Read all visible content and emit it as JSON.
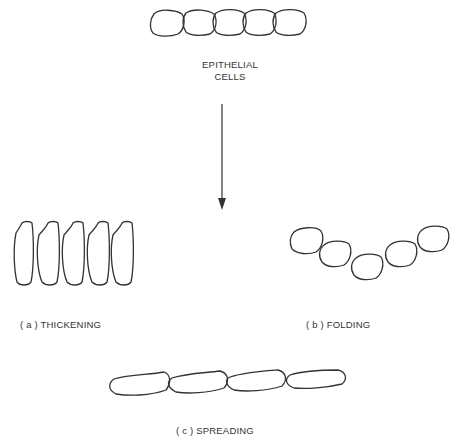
{
  "diagram": {
    "source": {
      "label_line1": "EPITHELIAL",
      "label_line2": "CELLS",
      "cell_count": 5
    },
    "transition": {
      "icon": "arrow-down-icon"
    },
    "outcomes": [
      {
        "id": "a",
        "label": "( a )  THICKENING",
        "cell_count": 5,
        "shape": "tall-elongated"
      },
      {
        "id": "b",
        "label": "( b )  FOLDING",
        "cell_count": 5,
        "shape": "rounded-curved-row"
      },
      {
        "id": "c",
        "label": "( c )  SPREADING",
        "cell_count": 4,
        "shape": "flat-elongated"
      }
    ],
    "stroke_color": "#333333",
    "background": "#ffffff"
  }
}
